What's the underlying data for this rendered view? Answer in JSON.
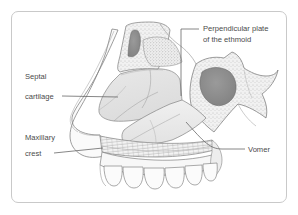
{
  "figure": {
    "kind": "anatomical-illustration",
    "view": "lateral / sagittal",
    "frame": {
      "border_color": "#c9c9c9",
      "background": "#ffffff",
      "corner_radius": "7px"
    },
    "palette": {
      "outline": "#6e6e6e",
      "fine_outline": "#8d8d8d",
      "cartilage_fill": "#e3e3e3",
      "bone_fill": "#ececec",
      "bone_fill_light": "#f2f2f2",
      "sinus_dark": "#8a8a8a",
      "sinus_dark_alt": "#959595",
      "stipple": "#9a9a9a",
      "label_text": "#4a4a4a",
      "leader_line": "#5f5f5f",
      "tooth_fill": "#fbfbfb"
    },
    "labels": [
      {
        "id": "perpendicular-plate-ethmoid",
        "line1": "Perpendicular plate",
        "line2": "of the ethmoid",
        "text_x": 203,
        "text_y1": 31,
        "text_y2": 42,
        "align": "start",
        "leader": "M 199 29 L 181 29 L 181 96"
      },
      {
        "id": "septal-cartilage",
        "line1": "Septal",
        "line2": "cartilage",
        "text_x": 25,
        "text_y1": 79,
        "text_y2": 99,
        "align": "start",
        "leader": "M 62 96 L 118 97"
      },
      {
        "id": "maxillary-crest",
        "line1": "Maxillary",
        "line2": "crest",
        "text_x": 25,
        "text_y1": 140,
        "text_y2": 156,
        "align": "start",
        "leader": "M 54 153 L 103 148"
      },
      {
        "id": "vomer",
        "line1": "Vomer",
        "line2": "",
        "text_x": 248,
        "text_y1": 152,
        "text_y2": 0,
        "align": "start",
        "leader": "M 245 149 L 222 149 C 210 149 204 142 186 122"
      }
    ]
  }
}
